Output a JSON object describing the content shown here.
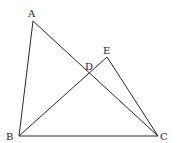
{
  "figure": {
    "type": "geometry",
    "width": 182,
    "height": 143,
    "stroke_color": "#2a2a2a",
    "label_color": "#222222",
    "points": [
      {
        "id": "A",
        "label": "A",
        "x": 33,
        "y": 21,
        "lx": 28,
        "ly": 17
      },
      {
        "id": "B",
        "label": "B",
        "x": 19,
        "y": 136,
        "lx": 6,
        "ly": 140
      },
      {
        "id": "C",
        "label": "C",
        "x": 158,
        "y": 136,
        "lx": 160,
        "ly": 140
      },
      {
        "id": "D",
        "label": "D",
        "x": 89,
        "y": 73,
        "lx": 85,
        "ly": 70
      },
      {
        "id": "E",
        "label": "E",
        "x": 107,
        "y": 57,
        "lx": 103,
        "ly": 54
      }
    ],
    "segments": [
      {
        "from": "A",
        "to": "B"
      },
      {
        "from": "A",
        "to": "C"
      },
      {
        "from": "B",
        "to": "C"
      },
      {
        "from": "B",
        "to": "E"
      },
      {
        "from": "E",
        "to": "C"
      }
    ]
  }
}
